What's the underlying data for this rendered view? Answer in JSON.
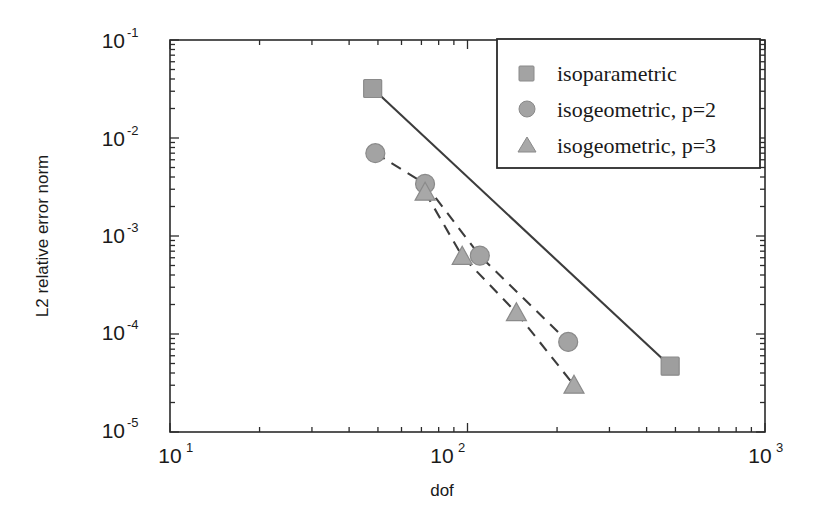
{
  "chart_data": {
    "type": "line",
    "title": "",
    "xlabel": "dof",
    "ylabel": "L2 relative error norm",
    "xscale": "log",
    "yscale": "log",
    "xlim": [
      10,
      1000
    ],
    "ylim": [
      1e-05,
      0.1
    ],
    "grid": false,
    "legend_position": "top-right",
    "xtick_labels": [
      "10",
      "10",
      "10"
    ],
    "xtick_exponents": [
      "1",
      "2",
      "3"
    ],
    "xtick_values": [
      10,
      100,
      1000
    ],
    "ytick_labels": [
      "10",
      "10",
      "10",
      "10",
      "10"
    ],
    "ytick_exponents": [
      "-1",
      "-2",
      "-3",
      "-4",
      "-5"
    ],
    "ytick_values": [
      0.1,
      0.01,
      0.001,
      0.0001,
      1e-05
    ],
    "series": [
      {
        "name": "isoparametric",
        "marker": "square",
        "linestyle": "solid",
        "color": "#9e9e9e",
        "line_color": "#3c3c3c",
        "x": [
          48,
          480
        ],
        "y": [
          0.032,
          4.7e-05
        ]
      },
      {
        "name": "isogeometric, p=2",
        "marker": "circle",
        "linestyle": "dashed",
        "color": "#a3a3a3",
        "line_color": "#3c3c3c",
        "x": [
          49,
          72,
          110,
          218
        ],
        "y": [
          0.007,
          0.0034,
          0.00063,
          8.3e-05
        ]
      },
      {
        "name": "isogeometric, p=3",
        "marker": "triangle",
        "linestyle": "dashed",
        "color": "#a8a8a8",
        "line_color": "#3c3c3c",
        "x": [
          72,
          96,
          146,
          228
        ],
        "y": [
          0.0028,
          0.00062,
          0.000165,
          3e-05
        ]
      }
    ]
  },
  "legend": {
    "entries": [
      {
        "label": "isoparametric"
      },
      {
        "label": "isogeometric, p=2"
      },
      {
        "label": "isogeometric, p=3"
      }
    ]
  },
  "colors": {
    "axis": "#2b2b2b",
    "marker_gray": "#a3a3a3",
    "marker_edge": "#8a8a8a",
    "line_dark": "#3c3c3c",
    "legend_border": "#2b2b2b",
    "background": "#ffffff"
  }
}
